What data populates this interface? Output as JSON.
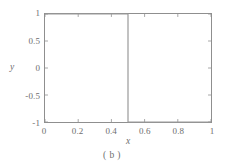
{
  "figure": {
    "caption": "( b )",
    "background_color": "#ffffff",
    "frame_color": "#8f8f8f",
    "text_color": "#6e6e6e"
  },
  "chart_data": {
    "type": "line",
    "title": "",
    "subtitle": "",
    "xlabel": "x",
    "ylabel": "y",
    "xlim": [
      0,
      1
    ],
    "ylim": [
      -1,
      1
    ],
    "grid": false,
    "legend": null,
    "legend_position": "none",
    "line_color": "#9a9a9a",
    "line_width": 1.2,
    "annotations": [],
    "xticks": [
      0,
      0.2,
      0.4,
      0.6,
      0.8,
      1
    ],
    "xtick_labels": [
      "0",
      "0.2",
      "0.4",
      "0.6",
      "0.8",
      "1"
    ],
    "yticks": [
      -1,
      -0.5,
      0,
      0.5,
      1
    ],
    "ytick_labels": [
      "-1",
      "-0.5",
      "0",
      "0.5",
      "1"
    ],
    "series": [
      {
        "name": "square wave",
        "x": [
          0,
          0.5,
          0.5,
          1
        ],
        "y": [
          1,
          1,
          -1,
          -1
        ]
      }
    ]
  }
}
